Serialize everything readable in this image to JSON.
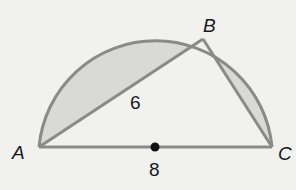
{
  "figure": {
    "points": {
      "A": {
        "label": "A"
      },
      "B": {
        "label": "B"
      },
      "C": {
        "label": "C"
      },
      "center": {
        "label": ""
      }
    },
    "measurements": {
      "AB": "6",
      "AC": "8"
    },
    "colors": {
      "background": "#f1f1f0",
      "shaded": "#d9d9d7",
      "stroke": "#8a8a8a",
      "center_dot": "#111111"
    }
  }
}
